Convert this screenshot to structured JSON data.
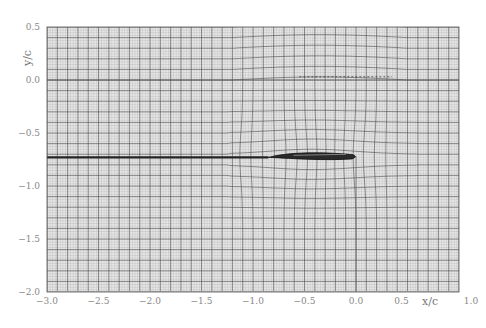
{
  "chart_data": {
    "type": "heatmap",
    "title": "",
    "xlabel": "x/c",
    "ylabel": "y/c",
    "xlim": [
      -3.0,
      1.0
    ],
    "ylim": [
      -2.0,
      0.5
    ],
    "x_ticks": [
      -3.0,
      -2.5,
      -2.0,
      -1.5,
      -1.0,
      -0.5,
      0.0,
      0.5,
      1.0
    ],
    "x_tick_labels": [
      "−3.0",
      "−2.5",
      "−2.0",
      "−1.5",
      "−1.0",
      "−0.5",
      "0.0",
      "0.5",
      "1.0"
    ],
    "y_ticks": [
      0.5,
      0.0,
      -0.5,
      -1.0,
      -1.5,
      -2.0
    ],
    "y_tick_labels": [
      "0.5",
      "0.0",
      "−0.5",
      "−1.0",
      "−1.5",
      "−2.0"
    ],
    "grid": true,
    "grid_fine_spacing": 0.025,
    "grid_coarse_spacing": 0.1,
    "body": {
      "x_start": -0.85,
      "x_end": 0.0,
      "y_center": -0.72,
      "max_thickness": 0.07
    },
    "wake": {
      "x_start": -3.0,
      "x_end": -0.85,
      "y": -0.73
    },
    "reference_line": {
      "y": 0.0,
      "style": "thin"
    },
    "dashed_line": {
      "x_start": -0.55,
      "x_end": 0.35,
      "y": 0.03
    },
    "legend": null
  },
  "axes": {
    "x_label": "x/c",
    "y_label": "y/c"
  }
}
